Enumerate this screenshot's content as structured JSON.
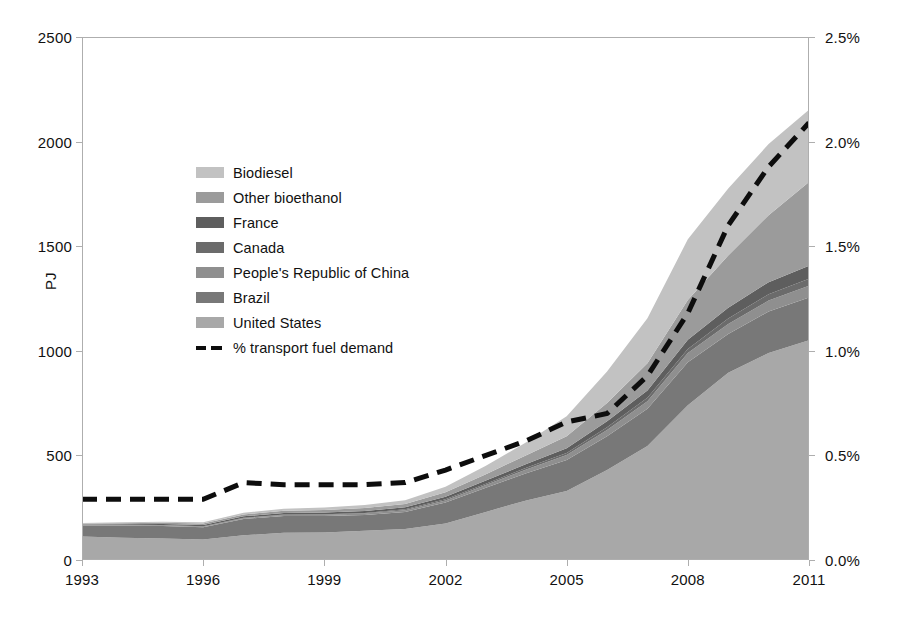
{
  "chart_data": {
    "type": "area",
    "title": "",
    "subtitle": "",
    "xlabel": "",
    "ylabel": "PJ",
    "y2label": "",
    "grid": false,
    "legend_position": "inside-upper-left",
    "x": [
      1993,
      1994,
      1995,
      1996,
      1997,
      1998,
      1999,
      2000,
      2001,
      2002,
      2003,
      2004,
      2005,
      2006,
      2007,
      2008,
      2009,
      2010,
      2011
    ],
    "xticks": [
      "1993",
      "1996",
      "1999",
      "2002",
      "2005",
      "2008",
      "2011"
    ],
    "yticks": [
      "0",
      "500",
      "1000",
      "1500",
      "2000",
      "2500"
    ],
    "ylim": [
      0,
      2500
    ],
    "y2ticks": [
      "0.0%",
      "0.5%",
      "1.0%",
      "1.5%",
      "2.0%",
      "2.5%"
    ],
    "y2lim": [
      0,
      2.5
    ],
    "stack_order_bottom_to_top": [
      "United States",
      "Brazil",
      "People's Republic of China",
      "Canada",
      "France",
      "Other bioethanol",
      "Biodiesel"
    ],
    "series": [
      {
        "name": "United States",
        "color": "#a8a8a8",
        "axis": "left",
        "values": [
          112,
          106,
          103,
          98,
          118,
          130,
          132,
          140,
          148,
          175,
          230,
          285,
          330,
          430,
          545,
          740,
          895,
          990,
          1050
        ]
      },
      {
        "name": "Brazil",
        "color": "#787878",
        "axis": "left",
        "values": [
          52,
          58,
          60,
          58,
          78,
          80,
          78,
          75,
          82,
          100,
          115,
          130,
          148,
          162,
          178,
          205,
          185,
          198,
          205
        ]
      },
      {
        "name": "People's Republic of China",
        "color": "#8f8f8f",
        "axis": "left",
        "values": [
          2,
          2,
          3,
          3,
          4,
          5,
          6,
          7,
          8,
          10,
          14,
          18,
          24,
          30,
          36,
          44,
          48,
          52,
          56
        ]
      },
      {
        "name": "Canada",
        "color": "#6b6b6b",
        "axis": "left",
        "values": [
          1,
          1,
          1,
          2,
          2,
          2,
          3,
          3,
          4,
          5,
          6,
          8,
          10,
          13,
          16,
          20,
          26,
          30,
          34
        ]
      },
      {
        "name": "France",
        "color": "#5e5e5e",
        "axis": "left",
        "values": [
          3,
          4,
          5,
          6,
          7,
          8,
          8,
          9,
          10,
          12,
          15,
          18,
          22,
          28,
          35,
          44,
          52,
          58,
          62
        ]
      },
      {
        "name": "Other bioethanol",
        "color": "#9b9b9b",
        "axis": "left",
        "values": [
          4,
          5,
          6,
          7,
          9,
          10,
          12,
          14,
          16,
          22,
          30,
          42,
          58,
          88,
          130,
          190,
          250,
          320,
          400
        ]
      },
      {
        "name": "Biodiesel",
        "color": "#c2c2c2",
        "axis": "left",
        "values": [
          3,
          4,
          5,
          6,
          8,
          10,
          12,
          15,
          18,
          26,
          40,
          62,
          95,
          150,
          215,
          290,
          320,
          340,
          345
        ]
      },
      {
        "name": "% transport fuel demand",
        "color": "#0d0d0d",
        "axis": "right",
        "style": "dashed",
        "values": [
          0.29,
          0.29,
          0.29,
          0.29,
          0.37,
          0.36,
          0.36,
          0.36,
          0.37,
          0.43,
          0.5,
          0.57,
          0.66,
          0.7,
          0.88,
          1.18,
          1.6,
          1.88,
          2.09
        ]
      }
    ],
    "legend": [
      {
        "label": "Biodiesel",
        "color": "#c2c2c2",
        "style": "swatch"
      },
      {
        "label": "Other bioethanol",
        "color": "#9b9b9b",
        "style": "swatch"
      },
      {
        "label": "France",
        "color": "#5e5e5e",
        "style": "swatch"
      },
      {
        "label": "Canada",
        "color": "#6b6b6b",
        "style": "swatch"
      },
      {
        "label": "People's Republic of China",
        "color": "#8f8f8f",
        "style": "swatch"
      },
      {
        "label": "Brazil",
        "color": "#787878",
        "style": "swatch"
      },
      {
        "label": "United States",
        "color": "#a8a8a8",
        "style": "swatch"
      },
      {
        "label": "% transport fuel demand",
        "color": "#0d0d0d",
        "style": "dashed-line"
      }
    ]
  }
}
